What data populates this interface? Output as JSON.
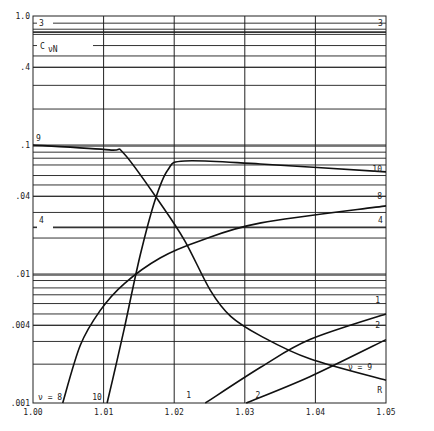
{
  "chart_data": {
    "type": "line",
    "title": "",
    "xlabel": "",
    "ylabel": "C_νN",
    "xscale": "linear",
    "yscale": "log",
    "xlim": [
      1.0,
      1.05
    ],
    "ylim": [
      0.001,
      1.0
    ],
    "grid": true,
    "x_ticks": [
      {
        "value": 1.0,
        "label": "1.00"
      },
      {
        "value": 1.01,
        "label": "1.01"
      },
      {
        "value": 1.02,
        "label": "1.02"
      },
      {
        "value": 1.03,
        "label": "1.03"
      },
      {
        "value": 1.04,
        "label": "1.04"
      },
      {
        "value": 1.05,
        "label": "1.05"
      }
    ],
    "y_ticks": [
      {
        "value": 1.0,
        "label": "1.0"
      },
      {
        "value": 0.4,
        "label": ".4"
      },
      {
        "value": 0.1,
        "label": ".1"
      },
      {
        "value": 0.04,
        "label": ".04"
      },
      {
        "value": 0.01,
        "label": ".01"
      },
      {
        "value": 0.004,
        "label": ".004"
      },
      {
        "value": 0.001,
        "label": ".001"
      }
    ],
    "horizontal_reference_lines": [
      {
        "label": "3",
        "value": 0.88,
        "thick": false
      },
      {
        "label": "",
        "value": 0.79,
        "thick": false
      },
      {
        "label": "",
        "value": 0.75,
        "thick": true
      },
      {
        "label": "",
        "value": 0.72,
        "thick": false
      },
      {
        "label": "C_νN",
        "value": 0.59,
        "thick": false
      },
      {
        "label": "",
        "value": 0.49,
        "thick": false
      },
      {
        "label": "",
        "value": 0.4,
        "thick": false
      },
      {
        "label": "",
        "value": 0.29,
        "thick": false
      },
      {
        "label": "",
        "value": 0.19,
        "thick": false
      },
      {
        "label": "",
        "value": 0.098,
        "thick": false
      },
      {
        "label": "",
        "value": 0.088,
        "thick": false
      },
      {
        "label": "",
        "value": 0.079,
        "thick": false
      },
      {
        "label": "",
        "value": 0.07,
        "thick": false
      },
      {
        "label": "",
        "value": 0.058,
        "thick": false
      },
      {
        "label": "",
        "value": 0.049,
        "thick": false
      },
      {
        "label": "",
        "value": 0.04,
        "thick": false
      },
      {
        "label": "",
        "value": 0.03,
        "thick": false
      },
      {
        "label": "4",
        "value": 0.023,
        "thick": true
      },
      {
        "label": "",
        "value": 0.019,
        "thick": false
      },
      {
        "label": "",
        "value": 0.0098,
        "thick": false
      },
      {
        "label": "",
        "value": 0.0089,
        "thick": false
      },
      {
        "label": "",
        "value": 0.0078,
        "thick": false
      },
      {
        "label": "",
        "value": 0.0069,
        "thick": false
      },
      {
        "label": "",
        "value": 0.0059,
        "thick": false
      },
      {
        "label": "",
        "value": 0.0049,
        "thick": false
      },
      {
        "label": "",
        "value": 0.004,
        "thick": false
      },
      {
        "label": "",
        "value": 0.003,
        "thick": false
      },
      {
        "label": "",
        "value": 0.002,
        "thick": false
      }
    ],
    "series": [
      {
        "name": "9",
        "label_start": "9",
        "label_end": "ν = 9",
        "end_tag": "R",
        "x": [
          1.0,
          1.0108,
          1.0129,
          1.018,
          1.0215,
          1.0251,
          1.028,
          1.0323,
          1.0392,
          1.05
        ],
        "y": [
          0.1,
          0.0917,
          0.0854,
          0.0355,
          0.0181,
          0.0075,
          0.0047,
          0.0033,
          0.0022,
          0.0015
        ]
      },
      {
        "name": "10",
        "label_start": "10",
        "label_end": "10",
        "x": [
          1.0105,
          1.0116,
          1.0129,
          1.0152,
          1.0173,
          1.0191,
          1.0215,
          1.0322,
          1.05
        ],
        "y": [
          0.001,
          0.00181,
          0.00372,
          0.0141,
          0.0375,
          0.0641,
          0.0752,
          0.0712,
          0.0619
        ]
      },
      {
        "name": "8",
        "label_start": "ν = 8",
        "label_end": "8",
        "x": [
          1.0042,
          1.0067,
          1.0095,
          1.0129,
          1.018,
          1.0237,
          1.0323,
          1.05
        ],
        "y": [
          0.001,
          0.0028,
          0.0052,
          0.0084,
          0.0133,
          0.0181,
          0.0249,
          0.0337
        ]
      },
      {
        "name": "1",
        "label_start": "1",
        "label_end": "1",
        "x": [
          1.0244,
          1.0323,
          1.0392,
          1.05
        ],
        "y": [
          0.001,
          0.0019,
          0.0031,
          0.0049
        ]
      },
      {
        "name": "2",
        "label_start": "2",
        "label_end": "2",
        "x": [
          1.0302,
          1.0392,
          1.05
        ],
        "y": [
          0.001,
          0.0016,
          0.0031
        ]
      }
    ]
  }
}
